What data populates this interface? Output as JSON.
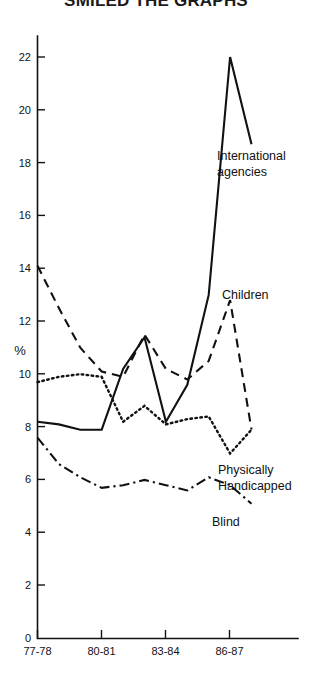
{
  "chart_data": {
    "type": "line",
    "title": "SMILED THE GRAPHS",
    "xlabel": "",
    "ylabel": "%",
    "x": [
      "77-78",
      "78-79",
      "79-80",
      "80-81",
      "81-82",
      "82-83",
      "83-84",
      "84-85",
      "85-86",
      "86-87",
      "87-88"
    ],
    "tick_x": [
      "77-78",
      "80-81",
      "83-84",
      "86-87"
    ],
    "ylim": [
      0,
      22
    ],
    "yticks": [
      0,
      2,
      4,
      6,
      8,
      10,
      12,
      14,
      16,
      18,
      20,
      22
    ],
    "ytick_labels": [
      "0",
      "2",
      "4",
      "6",
      "8",
      "10",
      "12",
      "14",
      "16",
      "18",
      "20",
      "22"
    ],
    "grid": false,
    "legend_position": "inline-right",
    "series": [
      {
        "name": "International agencies",
        "label": "International agencies",
        "label_line1": "International",
        "label_line2": "agencies",
        "style": "solid",
        "color": "#111111",
        "values": [
          8.2,
          8.1,
          7.9,
          7.9,
          10.2,
          11.4,
          8.2,
          9.6,
          13.0,
          22.0,
          18.7
        ]
      },
      {
        "name": "Children",
        "label": "Children",
        "style": "dashed",
        "color": "#111111",
        "values": [
          14.1,
          12.5,
          11.0,
          10.1,
          9.9,
          11.5,
          10.2,
          9.8,
          10.5,
          12.8,
          7.9
        ]
      },
      {
        "name": "Physically Handicapped",
        "label": "Physically Handicapped",
        "label_line1": "Physically",
        "label_line2": "Handicapped",
        "style": "dotted",
        "color": "#111111",
        "values": [
          9.7,
          9.9,
          10.0,
          9.9,
          8.2,
          8.8,
          8.1,
          8.3,
          8.4,
          7.0,
          7.9
        ]
      },
      {
        "name": "Blind",
        "label": "Blind",
        "style": "dashdot",
        "color": "#111111",
        "values": [
          7.6,
          6.6,
          6.1,
          5.7,
          5.8,
          6.0,
          5.8,
          5.6,
          6.1,
          5.8,
          5.1
        ]
      }
    ]
  },
  "axis": {
    "y_unit": "%",
    "y_tick_labels": [
      "22",
      "20",
      "18",
      "16",
      "14",
      "12",
      "10",
      "8",
      "6",
      "4",
      "2",
      "0"
    ],
    "x_tick_labels": [
      "77-78",
      "80-81",
      "83-84",
      "86-87"
    ]
  },
  "labels": {
    "international_line1": "International",
    "international_line2": "agencies",
    "children": "Children",
    "physically_line1": "Physically",
    "physically_line2": "Handicapped",
    "blind": "Blind"
  },
  "header": {
    "title": "SMILED THE GRAPHS"
  }
}
